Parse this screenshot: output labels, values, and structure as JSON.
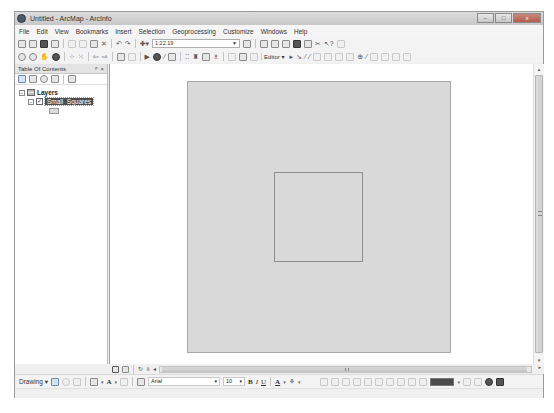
{
  "window": {
    "title": "Untitled - ArcMap - ArcInfo",
    "controls": {
      "minimize": "–",
      "maximize": "□",
      "close": "x"
    }
  },
  "menubar": {
    "items": [
      "File",
      "Edit",
      "View",
      "Bookmarks",
      "Insert",
      "Selection",
      "Geoprocessing",
      "Customize",
      "Windows",
      "Help"
    ]
  },
  "standard_toolbar": {
    "icons": [
      "new-document-icon",
      "open-icon",
      "save-icon",
      "print-icon",
      "cut-icon",
      "copy-icon",
      "paste-icon",
      "delete-icon",
      "undo-icon",
      "redo-icon",
      "add-data-icon"
    ],
    "scale": "1:22.19",
    "right_icons": [
      "editor-toolbar-icon",
      "table-of-contents-icon",
      "catalog-icon",
      "search-icon",
      "arctoolbox-icon",
      "python-icon",
      "model-builder-icon",
      "whats-this-icon"
    ]
  },
  "tools_toolbar": {
    "icons": [
      "zoom-in-icon",
      "zoom-out-icon",
      "pan-icon",
      "full-extent-icon",
      "fixed-zoom-in-icon",
      "fixed-zoom-out-icon",
      "back-icon",
      "forward-icon",
      "select-features-icon",
      "clear-selection-icon",
      "select-elements-icon",
      "identify-icon",
      "hyperlink-icon",
      "html-popup-icon",
      "measure-icon",
      "find-icon",
      "find-route-icon",
      "go-to-xy-icon",
      "time-slider-icon",
      "create-viewer-icon"
    ],
    "editor_label": "Editor ▾"
  },
  "toc": {
    "title": "Table Of Contents",
    "pin": "X",
    "close": "×",
    "tool_icons": [
      "list-by-drawing-order-icon",
      "list-by-source-icon",
      "list-by-visibility-icon",
      "list-by-selection-icon",
      "options-icon"
    ],
    "tree": {
      "root_label": "Layers",
      "root_expander": "−",
      "layer_label": "Small_Squares",
      "layer_expander": "−",
      "layer_checked": "✓"
    }
  },
  "map": {
    "page_color": "#d9d9d9",
    "square_border": "#8d8d8d"
  },
  "status_row": {
    "view_icons": [
      "data-view-icon",
      "layout-view-icon"
    ],
    "nav_icons": [
      "refresh-icon",
      "pause-drawing-icon",
      "scroll-left-icon"
    ],
    "scroll_right": "▸"
  },
  "drawing_toolbar": {
    "label": "Drawing ▾",
    "font": "Arial",
    "font_size": "10",
    "bold": "B",
    "italic": "I",
    "underline": "U",
    "font_color": "A",
    "fill_color_label": "▾",
    "dropdown": "▾"
  },
  "scrollbars": {
    "up": "▴",
    "down": "▾"
  }
}
